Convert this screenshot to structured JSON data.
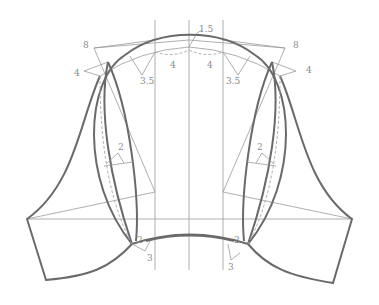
{
  "diagram": {
    "type": "sleeve-pattern-draft",
    "colors": {
      "background": "#ffffff",
      "outline": "#6a6a6a",
      "guide": "#9a9a9a",
      "dashed": "#a8a8a8",
      "label": "#8a8a8a"
    },
    "labels": {
      "top_center": "1.5",
      "left_outer_8": "8",
      "right_outer_8": "8",
      "left_4": "4",
      "right_4": "4",
      "left_35": "3.5",
      "right_35": "3.5",
      "center_left_4": "4",
      "center_right_4": "4",
      "left_mid_2": "2",
      "right_mid_2": "2",
      "left_bottom_3": "3",
      "right_bottom_3": "3",
      "left_bottom_2": "2",
      "right_bottom_2": "2"
    }
  }
}
